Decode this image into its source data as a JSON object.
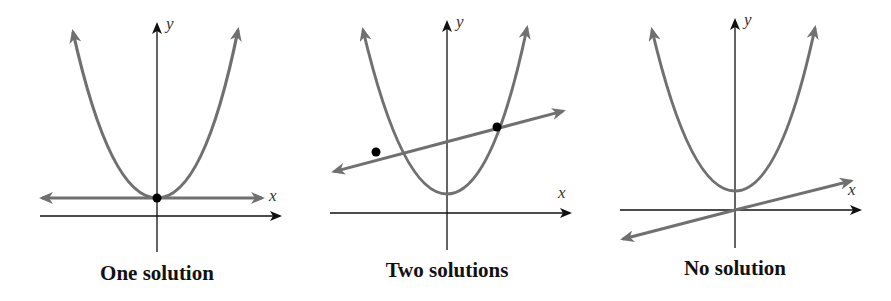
{
  "colors": {
    "curve": "#707070",
    "axis": "#111111",
    "point": "#000000",
    "background": "#ffffff"
  },
  "panels": [
    {
      "id": "one-solution",
      "caption": "One solution",
      "x_label": "x",
      "y_label": "y",
      "solution_count": 1,
      "line_type": "horizontal tangent line at parabola vertex",
      "intersection_points": 1
    },
    {
      "id": "two-solutions",
      "caption": "Two solutions",
      "x_label": "x",
      "y_label": "y",
      "solution_count": 2,
      "line_type": "line crossing parabola twice",
      "intersection_points": 2
    },
    {
      "id": "no-solution",
      "caption": "No solution",
      "x_label": "x",
      "y_label": "y",
      "solution_count": 0,
      "line_type": "line below parabola, no intersection",
      "intersection_points": 0
    }
  ]
}
